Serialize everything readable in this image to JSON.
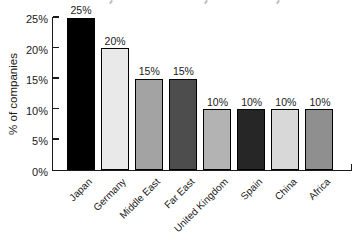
{
  "chart_data": {
    "type": "bar",
    "title": "",
    "ylabel": "% of companies",
    "xlabel": "",
    "categories": [
      "Japan",
      "Germany",
      "Middle East",
      "Far East",
      "United Kingdom",
      "Spain",
      "China",
      "Africa"
    ],
    "values": [
      25,
      20,
      15,
      15,
      10,
      10,
      10,
      10
    ],
    "value_labels": [
      "25%",
      "20%",
      "15%",
      "15%",
      "10%",
      "10%",
      "10%",
      "10%"
    ],
    "bar_colors": [
      "#000000",
      "#e9e9e9",
      "#a3a3a3",
      "#4d4d4d",
      "#b3b3b3",
      "#262626",
      "#d8d8d8",
      "#8f8f8f"
    ],
    "bar_border_color": "#000000",
    "yticks": [
      "25%",
      "20%",
      "15%",
      "10%",
      "5%",
      "0%"
    ],
    "ytick_values": [
      25,
      20,
      15,
      10,
      5,
      0
    ],
    "ylim": [
      0,
      25
    ],
    "grid": false,
    "legend": null,
    "axis_color": "#1a1a1a"
  }
}
